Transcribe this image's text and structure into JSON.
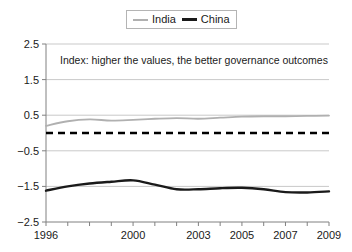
{
  "legend": {
    "position": "top-center",
    "entries": [
      {
        "label": "India",
        "color": "#b0b0b0",
        "icon": "line-swatch-icon"
      },
      {
        "label": "China",
        "color": "#1a1a1a",
        "icon": "line-swatch-icon"
      }
    ]
  },
  "annotation": {
    "text": "Index: higher the values, the better governance outcomes"
  },
  "axis": {
    "y_ticks": [
      "2.5",
      "1.5",
      "0.5",
      "−0.5",
      "−1.5",
      "−2.5"
    ],
    "x_ticks": [
      "1996",
      "2000",
      "2003",
      "2005",
      "2007",
      "2009"
    ]
  },
  "chart_data": {
    "type": "line",
    "title": "",
    "subtitle": "",
    "xlabel": "",
    "ylabel": "",
    "xlim": [
      1996,
      2009
    ],
    "ylim": [
      -2.5,
      2.5
    ],
    "grid": true,
    "legend_position": "top-center",
    "annotations": [
      {
        "text": "Index: higher the values, the better governance outcomes",
        "x": 1997,
        "y": 2.0
      },
      {
        "text": "zero reference line",
        "type": "hline",
        "y": 0,
        "style": "dashed",
        "color": "#000000"
      }
    ],
    "x": [
      1996,
      1997,
      1998,
      1999,
      2000,
      2001,
      2002,
      2003,
      2004,
      2005,
      2006,
      2007,
      2008,
      2009
    ],
    "categories": [
      "1996",
      "1997",
      "1998",
      "1999",
      "2000",
      "2001",
      "2002",
      "2003",
      "2004",
      "2005",
      "2006",
      "2007",
      "2008",
      "2009"
    ],
    "series": [
      {
        "name": "India",
        "color": "#b0b0b0",
        "values": [
          0.2,
          0.33,
          0.38,
          0.35,
          0.37,
          0.4,
          0.42,
          0.4,
          0.43,
          0.46,
          0.47,
          0.47,
          0.48,
          0.49
        ]
      },
      {
        "name": "China",
        "color": "#1a1a1a",
        "values": [
          -1.62,
          -1.5,
          -1.42,
          -1.37,
          -1.33,
          -1.45,
          -1.58,
          -1.58,
          -1.55,
          -1.54,
          -1.58,
          -1.66,
          -1.67,
          -1.64
        ]
      }
    ]
  }
}
